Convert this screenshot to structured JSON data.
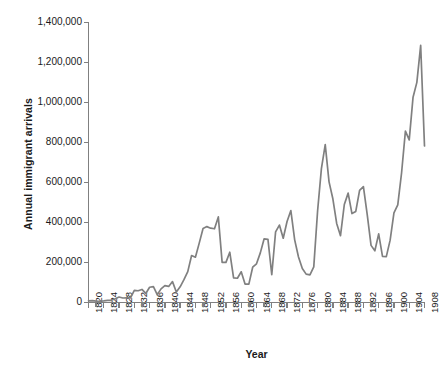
{
  "chart_data": {
    "type": "line",
    "title": "",
    "xlabel": "Year",
    "ylabel": "Annual immigrant arrivals",
    "xlim": [
      1820,
      1908
    ],
    "ylim": [
      0,
      1400000
    ],
    "grid": false,
    "legend": "none",
    "line_color": "#808080",
    "axis_color": "#808080",
    "text_color": "#1a1a1a",
    "ytick_labels": [
      "1,400,000",
      "1,200,000",
      "1,000,000",
      "800,000",
      "600,000",
      "400,000",
      "200,000",
      "0"
    ],
    "ytick_values": [
      1400000,
      1200000,
      1000000,
      800000,
      600000,
      400000,
      200000,
      0
    ],
    "xtick_labels": [
      "1820",
      "1824",
      "1828",
      "1832",
      "1836",
      "1840",
      "1844",
      "1848",
      "1852",
      "1856",
      "1860",
      "1864",
      "1868",
      "1872",
      "1876",
      "1880",
      "1884",
      "1888",
      "1892",
      "1896",
      "1900",
      "1904",
      "1908"
    ],
    "xtick_values": [
      1820,
      1824,
      1828,
      1832,
      1836,
      1840,
      1844,
      1848,
      1852,
      1856,
      1860,
      1864,
      1868,
      1872,
      1876,
      1880,
      1884,
      1888,
      1892,
      1896,
      1900,
      1904,
      1908
    ],
    "x": [
      1820,
      1821,
      1822,
      1823,
      1824,
      1825,
      1826,
      1827,
      1828,
      1829,
      1830,
      1831,
      1832,
      1833,
      1834,
      1835,
      1836,
      1837,
      1838,
      1839,
      1840,
      1841,
      1842,
      1843,
      1844,
      1845,
      1846,
      1847,
      1848,
      1849,
      1850,
      1851,
      1852,
      1853,
      1854,
      1855,
      1856,
      1857,
      1858,
      1859,
      1860,
      1861,
      1862,
      1863,
      1864,
      1865,
      1866,
      1867,
      1868,
      1869,
      1870,
      1871,
      1872,
      1873,
      1874,
      1875,
      1876,
      1877,
      1878,
      1879,
      1880,
      1881,
      1882,
      1883,
      1884,
      1885,
      1886,
      1887,
      1888,
      1889,
      1890,
      1891,
      1892,
      1893,
      1894,
      1895,
      1896,
      1897,
      1898,
      1899,
      1900,
      1901,
      1902,
      1903,
      1904,
      1905,
      1906,
      1907,
      1908
    ],
    "values": [
      8385,
      9127,
      6911,
      6354,
      7912,
      10199,
      10837,
      18875,
      27382,
      22520,
      23322,
      22633,
      60482,
      58640,
      65365,
      45374,
      76242,
      79340,
      38914,
      68069,
      84066,
      80289,
      104565,
      52496,
      78615,
      114371,
      154416,
      234968,
      226527,
      297024,
      369980,
      379466,
      371603,
      368645,
      427833,
      200877,
      200436,
      251306,
      123126,
      121282,
      153640,
      91918,
      91985,
      176282,
      193418,
      248120,
      318568,
      315722,
      138840,
      352768,
      387203,
      321350,
      404806,
      459803,
      313339,
      227498,
      169986,
      141857,
      138469,
      177826,
      457257,
      669431,
      788992,
      603322,
      518592,
      395346,
      334203,
      490109,
      546889,
      444427,
      455302,
      560319,
      579663,
      439730,
      285631,
      258536,
      343267,
      230832,
      229299,
      311715,
      448572,
      487918,
      648743,
      857046,
      812870,
      1026499,
      1100735,
      1285349,
      782870
    ]
  },
  "icons": {
    "tick": "axis-tick"
  }
}
